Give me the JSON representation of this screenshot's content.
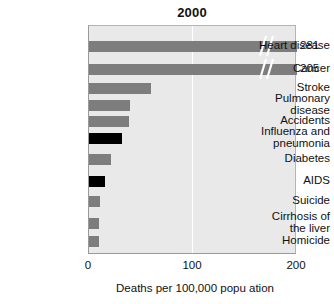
{
  "chart_data": {
    "type": "bar",
    "orientation": "horizontal",
    "title": "2000",
    "xlabel": "Deaths per 100,000 popu ation",
    "ylabel": "",
    "xlim": [
      0,
      200
    ],
    "grid": true,
    "gridlines": [
      100
    ],
    "legend": "none",
    "axis_ticks": [
      "0",
      "100",
      "200"
    ],
    "axis_tick_values": [
      0,
      100,
      200
    ],
    "categories": [
      "Heart disease",
      "Cancer",
      "Stroke",
      "Pulmonary\ndisease",
      "Accidents",
      "Influenza and\npneumonia",
      "Diabetes",
      "AIDS",
      "Suicide",
      "Cirrhosis of\nthe liver",
      "Homicide"
    ],
    "values": [
      281,
      205,
      60,
      39,
      38,
      32,
      21,
      15,
      11,
      10,
      10
    ],
    "value_labels": [
      "281",
      "205",
      "",
      "",
      "",
      "",
      "",
      "",
      "",
      "",
      ""
    ],
    "bar_colors": [
      "#7d7d7d",
      "#7d7d7d",
      "#7d7d7d",
      "#7d7d7d",
      "#7d7d7d",
      "#000000",
      "#7d7d7d",
      "#000000",
      "#7d7d7d",
      "#7d7d7d",
      "#7d7d7d"
    ],
    "axis_broken": [
      true,
      true,
      false,
      false,
      false,
      false,
      false,
      false,
      false,
      false,
      false
    ],
    "note": "Bars for Heart disease and Cancer extend past the 200 axis maximum and are drawn with a double-slash axis break symbol near their right end."
  },
  "colors": {
    "bar_gray": "#7d7d7d",
    "bar_black": "#000000",
    "plot_background": "#e9e9e9",
    "gridline": "#ffffff",
    "text": "#111111",
    "page_background": "#ffffff"
  }
}
